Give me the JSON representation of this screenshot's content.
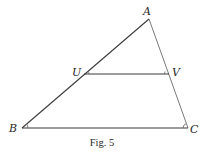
{
  "figure": {
    "caption": "Fig. 5",
    "points": {
      "A": "A",
      "B": "B",
      "C": "C",
      "U": "U",
      "V": "V"
    },
    "segments": [
      "AB",
      "AC",
      "BC",
      "UV"
    ]
  }
}
